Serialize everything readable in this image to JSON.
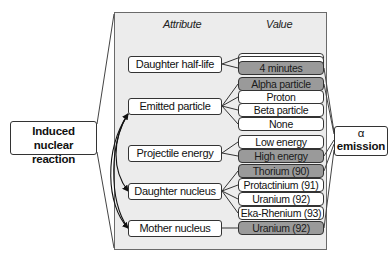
{
  "diagram": {
    "headers": {
      "attribute": "Attribute",
      "value": "Value"
    },
    "left_box": {
      "label_line1": "Induced nuclear",
      "label_line2": "reaction"
    },
    "right_box": {
      "label_line1": "α",
      "label_line2": "emission"
    },
    "attributes": [
      {
        "label": "Daughter half-life",
        "values": [
          {
            "label": "",
            "selected": false
          },
          {
            "label": "",
            "selected": false
          },
          {
            "label": "4 minutes",
            "selected": true
          }
        ]
      },
      {
        "label": "Emitted particle",
        "values": [
          {
            "label": "Alpha particle",
            "selected": true
          },
          {
            "label": "Proton",
            "selected": false
          },
          {
            "label": "Beta particle",
            "selected": false
          },
          {
            "label": "None",
            "selected": false
          }
        ]
      },
      {
        "label": "Projectile energy",
        "values": [
          {
            "label": "Low energy",
            "selected": false
          },
          {
            "label": "High energy",
            "selected": true
          }
        ]
      },
      {
        "label": "Daughter nucleus",
        "values": [
          {
            "label": "Thorium (90)",
            "selected": true
          },
          {
            "label": "Protactinium (91)",
            "selected": false
          },
          {
            "label": "Uranium (92)",
            "selected": false
          },
          {
            "label": "Eka-Rhenium (93)",
            "selected": false
          }
        ]
      },
      {
        "label": "Mother nucleus",
        "values": [
          {
            "label": "Uranium (92)",
            "selected": true
          }
        ]
      }
    ],
    "colors": {
      "panel": "#ececec",
      "selected": "#9a9a9a",
      "border": "#333333"
    }
  }
}
